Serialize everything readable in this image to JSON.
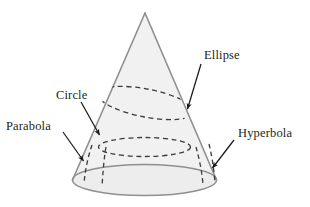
{
  "figure": {
    "background_color": "#ffffff",
    "width": 310,
    "height": 207
  },
  "cone": {
    "name": "cone",
    "fill_color": "#f0f0f0",
    "outline_color": "#8c8c8c",
    "base_fill_color": "#ececec",
    "apex": {
      "x": 145,
      "y": 13
    },
    "base_center": {
      "x": 144.5,
      "y": 180
    },
    "base_radius_x": 72,
    "base_radius_y": 15.5
  },
  "sections": {
    "dash_color": "#3a3a3a",
    "items": [
      {
        "id": "ellipse-section",
        "label": "Ellipse",
        "kind": "tilted-ellipse",
        "label_x": 204,
        "label_y": 59,
        "arrow_from": {
          "x": 201,
          "y": 64
        },
        "arrow_to": {
          "x": 186,
          "y": 111
        }
      },
      {
        "id": "circle-section",
        "label": "Circle",
        "kind": "horizontal-ellipse",
        "label_x": 68,
        "label_y": 99,
        "arrow_from": {
          "x": 81,
          "y": 102
        },
        "arrow_to": {
          "x": 101,
          "y": 137
        }
      },
      {
        "id": "parabola-section",
        "label": "Parabola",
        "kind": "vertical-curve-left",
        "label_x": 6,
        "label_y": 130,
        "arrow_from": {
          "x": 63,
          "y": 132
        },
        "arrow_to": {
          "x": 85,
          "y": 163
        }
      },
      {
        "id": "hyperbola-section",
        "label": "Hyperbola",
        "kind": "vertical-curve-right",
        "label_x": 238,
        "label_y": 137,
        "arrow_from": {
          "x": 234,
          "y": 140
        },
        "arrow_to": {
          "x": 211,
          "y": 170
        }
      }
    ]
  },
  "labels": {
    "ellipse": "Ellipse",
    "circle": "Circle",
    "parabola": "Parabola",
    "hyperbola": "Hyperbola"
  }
}
